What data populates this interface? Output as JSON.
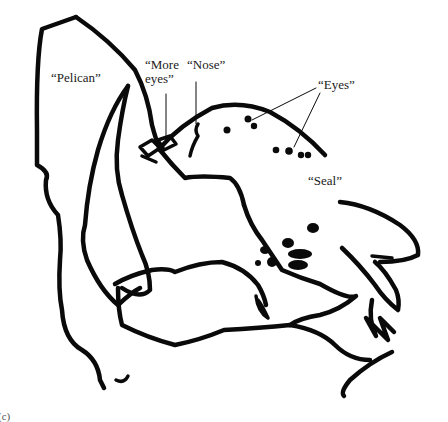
{
  "figure": {
    "labels": {
      "pelican": "“Pelican”",
      "more": "“More",
      "eyes_small": "eyes”",
      "nose": "“Nose”",
      "eyes": "“Eyes”",
      "seal": "“Seal”"
    },
    "panel_label": "(c)",
    "colors": {
      "ink": "#0a0a0a",
      "background": "#ffffff"
    }
  }
}
